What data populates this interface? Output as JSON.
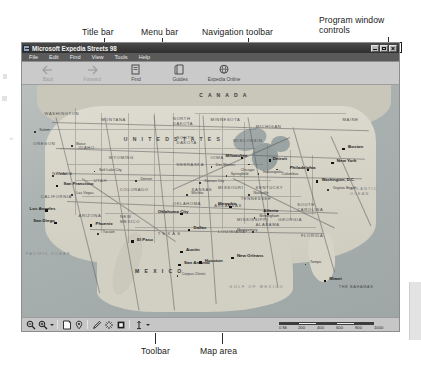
{
  "figure": {
    "callouts": [
      {
        "name": "title-bar",
        "text": "Title bar"
      },
      {
        "name": "menu-bar",
        "text": "Menu bar"
      },
      {
        "name": "navigation-toolbar",
        "text": "Navigation toolbar"
      },
      {
        "name": "program-window-controls",
        "text": "Program window controls"
      },
      {
        "name": "toolbar",
        "text": "Toolbar"
      },
      {
        "name": "map-area",
        "text": "Map area"
      }
    ]
  },
  "window": {
    "title": "Microsoft Expedia Streets 98",
    "controls": [
      {
        "name": "minimize",
        "label": "Minimize"
      },
      {
        "name": "maximize",
        "label": "Maximize"
      },
      {
        "name": "close",
        "label": "Close"
      }
    ]
  },
  "menu": {
    "items": [
      {
        "label": "File"
      },
      {
        "label": "Edit"
      },
      {
        "label": "Find"
      },
      {
        "label": "View"
      },
      {
        "label": "Tools"
      },
      {
        "label": "Help"
      }
    ]
  },
  "nav_toolbar": {
    "buttons": [
      {
        "label": "Back",
        "icon": "arrow-left-icon",
        "enabled": false
      },
      {
        "label": "Forward",
        "icon": "arrow-right-icon",
        "enabled": false
      },
      {
        "label": "Find",
        "icon": "find-icon",
        "enabled": true
      },
      {
        "label": "Guides",
        "icon": "guides-icon",
        "enabled": true
      },
      {
        "label": "Expedia Online",
        "icon": "globe-icon",
        "enabled": true
      }
    ]
  },
  "bottom_toolbar": {
    "tools": [
      {
        "name": "zoom-out-icon",
        "label": "Zoom Out"
      },
      {
        "name": "zoom-in-icon",
        "label": "Zoom In"
      },
      {
        "name": "zoom-dropdown-caret-icon",
        "label": "Zoom level"
      },
      {
        "name": "separator-1",
        "label": ""
      },
      {
        "name": "map-note-icon",
        "label": "Map Note"
      },
      {
        "name": "pushpin-icon",
        "label": "Pushpin"
      },
      {
        "name": "separator-2",
        "label": ""
      },
      {
        "name": "pencil-icon",
        "label": "Draw"
      },
      {
        "name": "highlighter-icon",
        "label": "Highlighter"
      },
      {
        "name": "filled-square-icon",
        "label": "Shape"
      },
      {
        "name": "separator-3",
        "label": ""
      },
      {
        "name": "measure-icon",
        "label": "Measure"
      },
      {
        "name": "measure-dropdown-caret-icon",
        "label": "Measure options"
      }
    ]
  },
  "scale_bar": {
    "unit_label": "0 Mi",
    "ticks": [
      "0 Mi",
      "200",
      "400",
      "600",
      "800",
      "1000"
    ]
  },
  "map": {
    "regions": [
      {
        "label": "C A N A D A",
        "x": 50,
        "y": 4
      },
      {
        "label": "U N I T E D   S T A T E S",
        "x": 38,
        "y": 24
      },
      {
        "label": "M E X I C O",
        "x": 33,
        "y": 80
      }
    ],
    "oceans": [
      {
        "label": "PACIFIC OCEAN",
        "x": 2,
        "y": 73
      },
      {
        "label": "ATLANTIC OCEAN",
        "x": 88,
        "y": 47
      },
      {
        "label": "Gulf of Mexico",
        "x": 57,
        "y": 87
      },
      {
        "label": "THE BAHAMAS",
        "x": 86,
        "y": 87
      }
    ],
    "states": [
      {
        "label": "WASHINGTON",
        "x": 7,
        "y": 12
      },
      {
        "label": "OREGON",
        "x": 4,
        "y": 25
      },
      {
        "label": "MONTANA",
        "x": 22,
        "y": 15
      },
      {
        "label": "NORTH DAKOTA",
        "x": 41,
        "y": 15
      },
      {
        "label": "SOUTH DAKOTA",
        "x": 41,
        "y": 23
      },
      {
        "label": "IDAHO",
        "x": 15,
        "y": 26
      },
      {
        "label": "WYOMING",
        "x": 24,
        "y": 30
      },
      {
        "label": "NEVADA",
        "x": 9,
        "y": 37
      },
      {
        "label": "UTAH",
        "x": 19,
        "y": 40
      },
      {
        "label": "COLORADO",
        "x": 28,
        "y": 43
      },
      {
        "label": "NEBRASKA",
        "x": 42,
        "y": 33
      },
      {
        "label": "KANSAS",
        "x": 44,
        "y": 43
      },
      {
        "label": "MINNESOTA",
        "x": 52,
        "y": 15
      },
      {
        "label": "IOWA",
        "x": 50,
        "y": 30
      },
      {
        "label": "MISSOURI",
        "x": 53,
        "y": 43
      },
      {
        "label": "WISCONSIN",
        "x": 57,
        "y": 23
      },
      {
        "label": "MICHIGAN",
        "x": 63,
        "y": 18
      },
      {
        "label": "CALIFORNIA",
        "x": 6,
        "y": 48
      },
      {
        "label": "ARIZONA",
        "x": 16,
        "y": 55
      },
      {
        "label": "NEW MEXICO",
        "x": 27,
        "y": 56
      },
      {
        "label": "OKLAHOMA",
        "x": 42,
        "y": 50
      },
      {
        "label": "TEXAS",
        "x": 38,
        "y": 62
      },
      {
        "label": "ARKANSAS",
        "x": 52,
        "y": 51
      },
      {
        "label": "LOUISIANA",
        "x": 53,
        "y": 62
      },
      {
        "label": "MISSISSIPPI",
        "x": 58,
        "y": 57
      },
      {
        "label": "ALABAMA",
        "x": 63,
        "y": 59
      },
      {
        "label": "GEORGIA",
        "x": 69,
        "y": 57
      },
      {
        "label": "FLORIDA",
        "x": 75,
        "y": 64
      },
      {
        "label": "TENNESSEE",
        "x": 60,
        "y": 48
      },
      {
        "label": "KENTUCKY",
        "x": 63,
        "y": 43
      },
      {
        "label": "SOUTH CAROLINA",
        "x": 74,
        "y": 51
      },
      {
        "label": "MAINE",
        "x": 86,
        "y": 14
      }
    ],
    "major_cities": [
      {
        "label": "San Francisco",
        "x": 10,
        "y": 42,
        "side": "right"
      },
      {
        "label": "Los Angeles",
        "x": 7,
        "y": 53,
        "side": "right"
      },
      {
        "label": "San Diego",
        "x": 9,
        "y": 58,
        "side": "right"
      },
      {
        "label": "Phoenix",
        "x": 19,
        "y": 59,
        "side": "right"
      },
      {
        "label": "El Paso",
        "x": 30,
        "y": 66,
        "side": "right"
      },
      {
        "label": "San Antonio",
        "x": 43,
        "y": 76,
        "side": "right"
      },
      {
        "label": "Austin",
        "x": 43,
        "y": 71,
        "side": "right"
      },
      {
        "label": "Houston",
        "x": 48,
        "y": 75,
        "side": "right"
      },
      {
        "label": "Dallas",
        "x": 45,
        "y": 61,
        "side": "right"
      },
      {
        "label": "Oklahoma City",
        "x": 43,
        "y": 54,
        "side": "right"
      },
      {
        "label": "New Orleans",
        "x": 57,
        "y": 73,
        "side": "right"
      },
      {
        "label": "Memphis",
        "x": 56,
        "y": 51,
        "side": "right"
      },
      {
        "label": "Atlanta",
        "x": 66,
        "y": 54,
        "side": "right"
      },
      {
        "label": "Miami",
        "x": 81,
        "y": 83,
        "side": "right"
      },
      {
        "label": "Milwaukee",
        "x": 59,
        "y": 30,
        "side": "right"
      },
      {
        "label": "Detroit",
        "x": 66,
        "y": 31,
        "side": "right"
      },
      {
        "label": "Philadelphia",
        "x": 76,
        "y": 35,
        "side": "right"
      },
      {
        "label": "New York",
        "x": 83,
        "y": 32,
        "side": "right"
      },
      {
        "label": "Boston",
        "x": 86,
        "y": 26,
        "side": "right"
      },
      {
        "label": "Washington, D.C.",
        "x": 79,
        "y": 40,
        "side": "right"
      }
    ],
    "minor_cities": [
      {
        "label": "Salem",
        "x": 4,
        "y": 19
      },
      {
        "label": "Boise",
        "x": 14,
        "y": 25
      },
      {
        "label": "Salt Lake City",
        "x": 20,
        "y": 36
      },
      {
        "label": "Denver",
        "x": 31,
        "y": 40
      },
      {
        "label": "Las Vegas",
        "x": 14,
        "y": 46
      },
      {
        "label": "Tucson",
        "x": 21,
        "y": 63
      },
      {
        "label": "Corpus Christi",
        "x": 43,
        "y": 81
      },
      {
        "label": "Des Moines",
        "x": 51,
        "y": 34
      },
      {
        "label": "Chicago",
        "x": 61,
        "y": 33
      },
      {
        "label": "Springfield",
        "x": 55,
        "y": 38
      },
      {
        "label": "Montgomery",
        "x": 62,
        "y": 62
      },
      {
        "label": "Birmingham",
        "x": 62,
        "y": 56
      },
      {
        "label": "Tampa",
        "x": 76,
        "y": 76
      },
      {
        "label": "Virginia Beach",
        "x": 82,
        "y": 44
      },
      {
        "label": "Nashville",
        "x": 61,
        "y": 46
      },
      {
        "label": "Kansas City",
        "x": 48,
        "y": 41
      },
      {
        "label": "Indianapolis",
        "x": 63,
        "y": 37
      },
      {
        "label": "Columbus",
        "x": 68,
        "y": 35
      },
      {
        "label": "Reno",
        "x": 9,
        "y": 38
      },
      {
        "label": "Wichita",
        "x": 44,
        "y": 46
      }
    ]
  }
}
